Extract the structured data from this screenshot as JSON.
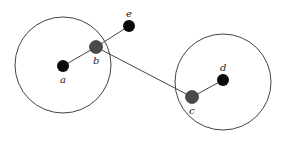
{
  "diagram": {
    "colors": {
      "line": "#444444",
      "node_dark": "#0a0a0a",
      "node_gray": "#4a4a4a"
    },
    "nodes": [
      {
        "id": "a",
        "label": "a",
        "fill": "dark"
      },
      {
        "id": "b",
        "label": "b",
        "fill": "gray"
      },
      {
        "id": "c",
        "label": "c",
        "fill": "gray"
      },
      {
        "id": "d",
        "label": "d",
        "fill": "dark"
      },
      {
        "id": "e",
        "label": "e",
        "fill": "dark"
      }
    ],
    "edges": [
      {
        "from": "a",
        "to": "b"
      },
      {
        "from": "b",
        "to": "e"
      },
      {
        "from": "b",
        "to": "c"
      },
      {
        "from": "c",
        "to": "d"
      }
    ],
    "circles": [
      {
        "id": "left-circle",
        "contains": [
          "a",
          "b"
        ]
      },
      {
        "id": "right-circle",
        "contains": [
          "c",
          "d"
        ]
      }
    ]
  }
}
